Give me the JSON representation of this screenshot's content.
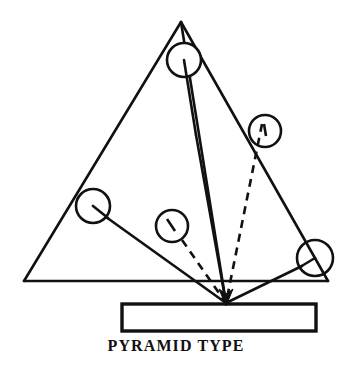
{
  "figure": {
    "caption": "PYRAMID TYPE",
    "title": "PYRAMID TYPE",
    "background_color": "#ffffff",
    "line_color": "#111111",
    "canvas": {
      "width": 352,
      "height": 369
    }
  },
  "diagram": {
    "type": "technical-line-drawing",
    "triangle": {
      "name": "pyramid-outline",
      "apex": {
        "x": 181,
        "y": 22
      },
      "bottom_left": {
        "x": 24,
        "y": 281
      },
      "bottom_right": {
        "x": 328,
        "y": 281
      },
      "stroke_width": 2.4
    },
    "back_edge": {
      "name": "pyramid-back-edge",
      "from": {
        "x": 181,
        "y": 22
      },
      "to": {
        "x": 226,
        "y": 303
      },
      "stroke_width": 2.4
    },
    "substrate": {
      "name": "substrate-plate",
      "x": 122,
      "y": 304,
      "width": 194,
      "height": 27,
      "stroke_width": 3.2,
      "fill": "#ffffff"
    },
    "convergence_point": {
      "x": 226,
      "y": 303
    },
    "sources": [
      {
        "id": "source-top",
        "cx": 184,
        "cy": 60,
        "r": 17,
        "line_style": "solid",
        "label": "top apex source"
      },
      {
        "id": "source-upper-right",
        "cx": 265,
        "cy": 131,
        "r": 16,
        "line_style": "dashed",
        "label": "upper right source"
      },
      {
        "id": "source-left",
        "cx": 93,
        "cy": 206,
        "r": 17,
        "line_style": "solid",
        "label": "left edge source"
      },
      {
        "id": "source-middle",
        "cx": 172,
        "cy": 226,
        "r": 16,
        "line_style": "dashed",
        "label": "center source"
      },
      {
        "id": "source-lower-right",
        "cx": 315,
        "cy": 258,
        "r": 18,
        "line_style": "solid",
        "label": "lower right source"
      }
    ],
    "beams": [
      {
        "id": "beam-top",
        "style": "solid",
        "from": {
          "x": 184,
          "y": 77
        },
        "to": {
          "x": 226,
          "y": 303
        }
      },
      {
        "id": "beam-upper-right",
        "style": "dashed",
        "from": {
          "x": 264,
          "y": 126
        },
        "to": {
          "x": 226,
          "y": 303
        }
      },
      {
        "id": "beam-left",
        "style": "solid",
        "from": {
          "x": 106,
          "y": 217
        },
        "to": {
          "x": 226,
          "y": 303
        }
      },
      {
        "id": "beam-middle",
        "style": "dashed",
        "from": {
          "x": 168,
          "y": 219
        },
        "to": {
          "x": 226,
          "y": 303
        }
      },
      {
        "id": "beam-lower-right",
        "style": "solid",
        "from": {
          "x": 302,
          "y": 266
        },
        "to": {
          "x": 226,
          "y": 303
        }
      }
    ],
    "arrowhead": {
      "name": "convergence-arrowhead",
      "tip": {
        "x": 226,
        "y": 303
      }
    }
  }
}
